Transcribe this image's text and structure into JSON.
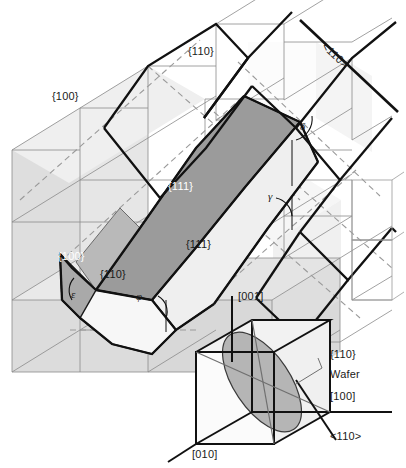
{
  "figure": {
    "type": "crystallographic-diagram",
    "background_color": "#ffffff",
    "palette": {
      "outline_bold": "#000000",
      "grid_line": "#808080",
      "dashed_line": "#909090",
      "face_white": "#fbfbfb",
      "face_light": "#e2e2e2",
      "face_medium": "#cbcbcb",
      "face_dark": "#9b9b9b",
      "face_wafer": "#b5b5b5",
      "text_dark": "#1a1a1a",
      "text_light": "#ffffff"
    }
  },
  "labels": {
    "plane_100_top_left": "{100}",
    "plane_110_top": "{110}",
    "direction_110_top_right": "<110>",
    "plane_111_dark": "{111}",
    "plane_111_light": "{111}",
    "plane_100_lower": "{100}",
    "plane_110_lower": "{110}",
    "angle_delta": "δ",
    "angle_gamma": "γ",
    "angle_epsilon": "ε",
    "angle_phi": "φ"
  },
  "inset": {
    "name": "wafer-orientation-cube",
    "axis_001": "[001]",
    "axis_010": "[010]",
    "axis_100": "[100]",
    "direction_110": "<110>",
    "wafer_plane": "{110}",
    "wafer_word": "Wafer"
  }
}
